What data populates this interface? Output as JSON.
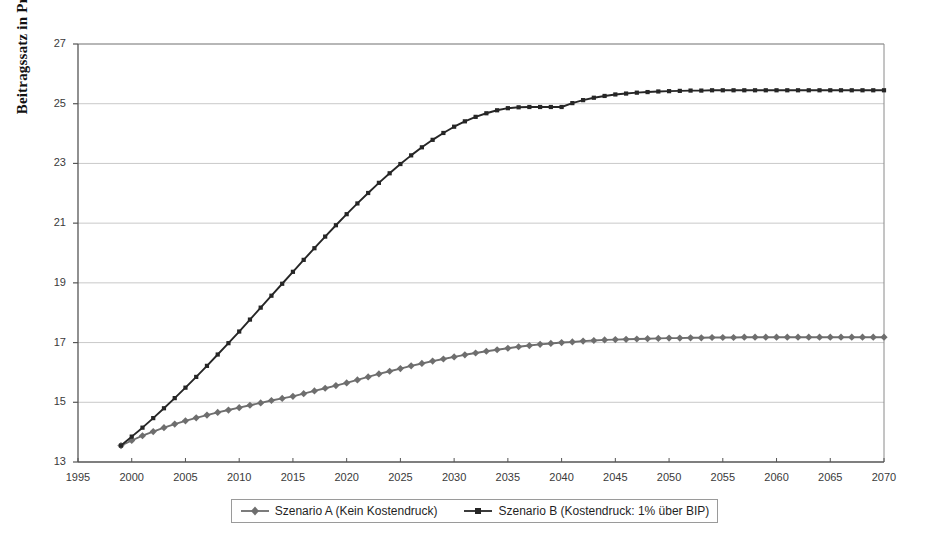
{
  "chart_data": {
    "type": "line",
    "title": "",
    "subtitle": "",
    "xlabel": "",
    "ylabel": "Beitragssatz in Prozent",
    "xlim": [
      1995,
      2070
    ],
    "ylim": [
      13,
      27
    ],
    "xticks": [
      1995,
      2000,
      2005,
      2010,
      2015,
      2020,
      2025,
      2030,
      2035,
      2040,
      2045,
      2050,
      2055,
      2060,
      2065,
      2070
    ],
    "yticks": [
      13,
      15,
      17,
      19,
      21,
      23,
      25,
      27
    ],
    "grid": "horizontal",
    "legend_position": "bottom",
    "x": [
      1999,
      2000,
      2001,
      2002,
      2003,
      2004,
      2005,
      2006,
      2007,
      2008,
      2009,
      2010,
      2011,
      2012,
      2013,
      2014,
      2015,
      2016,
      2017,
      2018,
      2019,
      2020,
      2021,
      2022,
      2023,
      2024,
      2025,
      2026,
      2027,
      2028,
      2029,
      2030,
      2031,
      2032,
      2033,
      2034,
      2035,
      2036,
      2037,
      2038,
      2039,
      2040,
      2041,
      2042,
      2043,
      2044,
      2045,
      2046,
      2047,
      2048,
      2049,
      2050,
      2051,
      2052,
      2053,
      2054,
      2055,
      2056,
      2057,
      2058,
      2059,
      2060,
      2061,
      2062,
      2063,
      2064,
      2065,
      2066,
      2067,
      2068,
      2069,
      2070
    ],
    "series": [
      {
        "name": "Szenario A (Kein Kostendruck)",
        "marker": "diamond",
        "color": "#6e6e6e",
        "values": [
          13.55,
          13.72,
          13.88,
          14.02,
          14.15,
          14.27,
          14.38,
          14.48,
          14.57,
          14.66,
          14.74,
          14.82,
          14.9,
          14.98,
          15.06,
          15.13,
          15.2,
          15.29,
          15.38,
          15.47,
          15.56,
          15.65,
          15.75,
          15.85,
          15.95,
          16.04,
          16.13,
          16.22,
          16.3,
          16.38,
          16.45,
          16.52,
          16.59,
          16.65,
          16.71,
          16.76,
          16.81,
          16.86,
          16.9,
          16.94,
          16.97,
          17.0,
          17.02,
          17.05,
          17.07,
          17.09,
          17.1,
          17.11,
          17.12,
          17.13,
          17.14,
          17.15,
          17.15,
          17.16,
          17.16,
          17.17,
          17.17,
          17.17,
          17.18,
          17.18,
          17.18,
          17.18,
          17.18,
          17.18,
          17.18,
          17.18,
          17.18,
          17.18,
          17.18,
          17.18,
          17.18,
          17.18
        ]
      },
      {
        "name": "Szenario B (Kostendruck: 1% über BIP)",
        "marker": "square",
        "color": "#262626",
        "values": [
          13.55,
          13.85,
          14.15,
          14.47,
          14.8,
          15.14,
          15.49,
          15.85,
          16.22,
          16.6,
          16.98,
          17.37,
          17.77,
          18.17,
          18.57,
          18.97,
          19.37,
          19.77,
          20.16,
          20.55,
          20.93,
          21.3,
          21.66,
          22.01,
          22.35,
          22.67,
          22.98,
          23.27,
          23.54,
          23.79,
          24.02,
          24.23,
          24.41,
          24.56,
          24.68,
          24.78,
          24.85,
          24.88,
          24.89,
          24.89,
          24.89,
          24.89,
          25.02,
          25.12,
          25.2,
          25.26,
          25.31,
          25.34,
          25.37,
          25.39,
          25.41,
          25.42,
          25.43,
          25.44,
          25.44,
          25.45,
          25.45,
          25.45,
          25.45,
          25.45,
          25.45,
          25.45,
          25.45,
          25.45,
          25.45,
          25.45,
          25.45,
          25.45,
          25.45,
          25.45,
          25.45,
          25.45
        ]
      }
    ],
    "colors": {
      "series_a": "#6e6e6e",
      "series_b": "#262626",
      "grid": "#c9c9c9",
      "axis": "#555555",
      "background": "#ffffff"
    }
  },
  "legend": {
    "entries": [
      {
        "label": "Szenario A (Kein Kostendruck)"
      },
      {
        "label": "Szenario B (Kostendruck: 1% über BIP)"
      }
    ]
  },
  "axes": {
    "y_title": "Beitragssatz in Prozent",
    "y_labels": [
      "27",
      "25",
      "23",
      "21",
      "19",
      "17",
      "15",
      "13"
    ],
    "x_labels": [
      "1995",
      "2000",
      "2005",
      "2010",
      "2015",
      "2020",
      "2025",
      "2030",
      "2035",
      "2040",
      "2045",
      "2050",
      "2055",
      "2060",
      "2065",
      "2070"
    ]
  }
}
